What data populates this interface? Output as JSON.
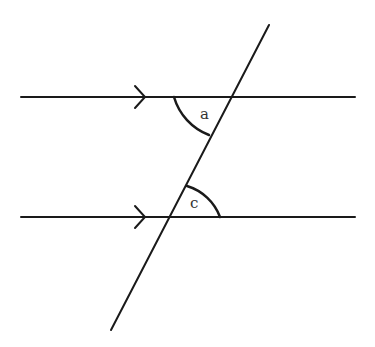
{
  "diagram": {
    "type": "parallel-lines-transversal",
    "stroke_color": "#1a1a1a",
    "parallel_lines": [
      {
        "id": "top",
        "x1": 21,
        "y1": 97,
        "x2": 355,
        "y2": 97,
        "arrow_x": 145
      },
      {
        "id": "bottom",
        "x1": 21,
        "y1": 217,
        "x2": 355,
        "y2": 217,
        "arrow_x": 145
      }
    ],
    "transversal": {
      "x1": 269,
      "y1": 25,
      "x2": 111,
      "y2": 330
    },
    "angles": [
      {
        "label": "a",
        "vertex": [
          232,
          97
        ],
        "radius": 58,
        "position": "below-left of top intersection"
      },
      {
        "label": "c",
        "vertex": [
          169,
          217
        ],
        "radius": 51,
        "position": "above-right of bottom intersection"
      }
    ],
    "labels": {
      "angle_a": "a",
      "angle_c": "c"
    }
  }
}
